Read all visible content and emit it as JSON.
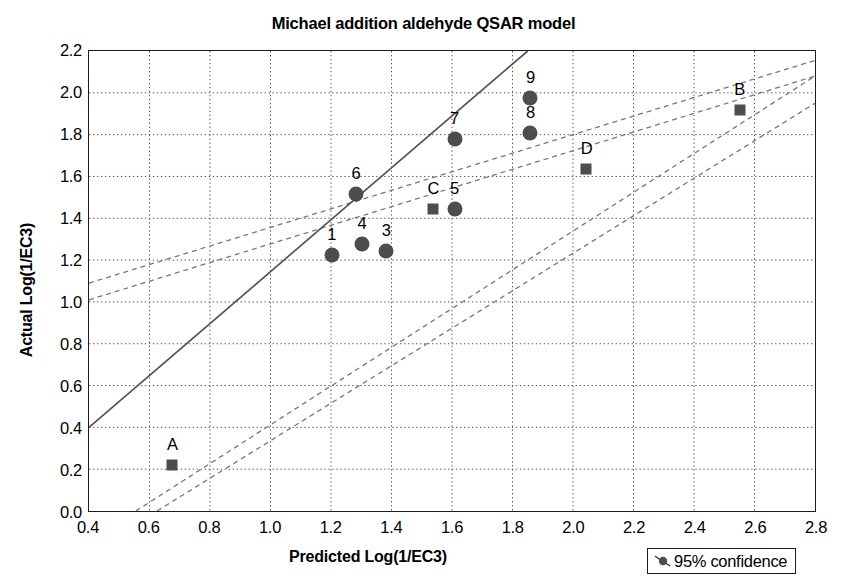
{
  "chart_data": {
    "type": "scatter",
    "title": "Michael addition aldehyde QSAR model",
    "xlabel": "Predicted Log(1/EC3)",
    "ylabel": "Actual Log(1/EC3)",
    "xlim": [
      0.4,
      2.8
    ],
    "ylim": [
      0.0,
      2.2
    ],
    "xticks": [
      "0.4",
      "0.6",
      "0.8",
      "1.0",
      "1.2",
      "1.4",
      "1.6",
      "1.8",
      "2.0",
      "2.2",
      "2.4",
      "2.6",
      "2.8"
    ],
    "yticks": [
      "0.0",
      "0.2",
      "0.4",
      "0.6",
      "0.8",
      "1.0",
      "1.2",
      "1.4",
      "1.6",
      "1.8",
      "2.0",
      "2.2"
    ],
    "xtick_values": [
      0.4,
      0.6,
      0.8,
      1.0,
      1.2,
      1.4,
      1.6,
      1.8,
      2.0,
      2.2,
      2.4,
      2.6,
      2.8
    ],
    "ytick_values": [
      0.0,
      0.2,
      0.4,
      0.6,
      0.8,
      1.0,
      1.2,
      1.4,
      1.6,
      1.8,
      2.0,
      2.2
    ],
    "grid": true,
    "grid_style": "dotted",
    "legend_position": "bottom-right",
    "marker_color": "#4d4d4d",
    "line_color": "#555555",
    "series": [
      {
        "name": "training-set",
        "marker": "circle",
        "points": [
          {
            "label": "1",
            "x": 1.2,
            "y": 1.23
          },
          {
            "label": "3",
            "x": 1.38,
            "y": 1.25
          },
          {
            "label": "4",
            "x": 1.3,
            "y": 1.28
          },
          {
            "label": "5",
            "x": 1.605,
            "y": 1.45
          },
          {
            "label": "6",
            "x": 1.28,
            "y": 1.52
          },
          {
            "label": "7",
            "x": 1.605,
            "y": 1.78
          },
          {
            "label": "8",
            "x": 1.855,
            "y": 1.81
          },
          {
            "label": "9",
            "x": 1.855,
            "y": 1.975
          }
        ]
      },
      {
        "name": "test-set",
        "marker": "square",
        "points": [
          {
            "label": "A",
            "x": 0.675,
            "y": 0.23
          },
          {
            "label": "B",
            "x": 2.545,
            "y": 1.92
          },
          {
            "label": "C",
            "x": 1.535,
            "y": 1.45
          },
          {
            "label": "D",
            "x": 2.04,
            "y": 1.64
          }
        ]
      }
    ],
    "fit_line": {
      "name": "regression-line",
      "style": "solid",
      "x0": 0.4,
      "y0": 0.4,
      "x1": 1.85,
      "y1": 2.2
    },
    "confidence_bands": [
      {
        "name": "upper-outer",
        "style": "dashed",
        "x0": 0.4,
        "y0": 1.09,
        "x1": 2.8,
        "y1": 2.155
      },
      {
        "name": "upper-inner",
        "style": "dashed",
        "x0": 0.4,
        "y0": 1.01,
        "x1": 2.8,
        "y1": 2.08
      },
      {
        "name": "lower-inner",
        "style": "dashed",
        "x0": 0.555,
        "y0": 0.0,
        "x1": 2.8,
        "y1": 2.08
      },
      {
        "name": "lower-outer",
        "style": "dashed",
        "x0": 0.625,
        "y0": 0.0,
        "x1": 2.8,
        "y1": 1.95
      }
    ]
  },
  "legend": {
    "items": [
      {
        "label": "95% confidence",
        "marker": "circle-with-ticks"
      }
    ]
  }
}
